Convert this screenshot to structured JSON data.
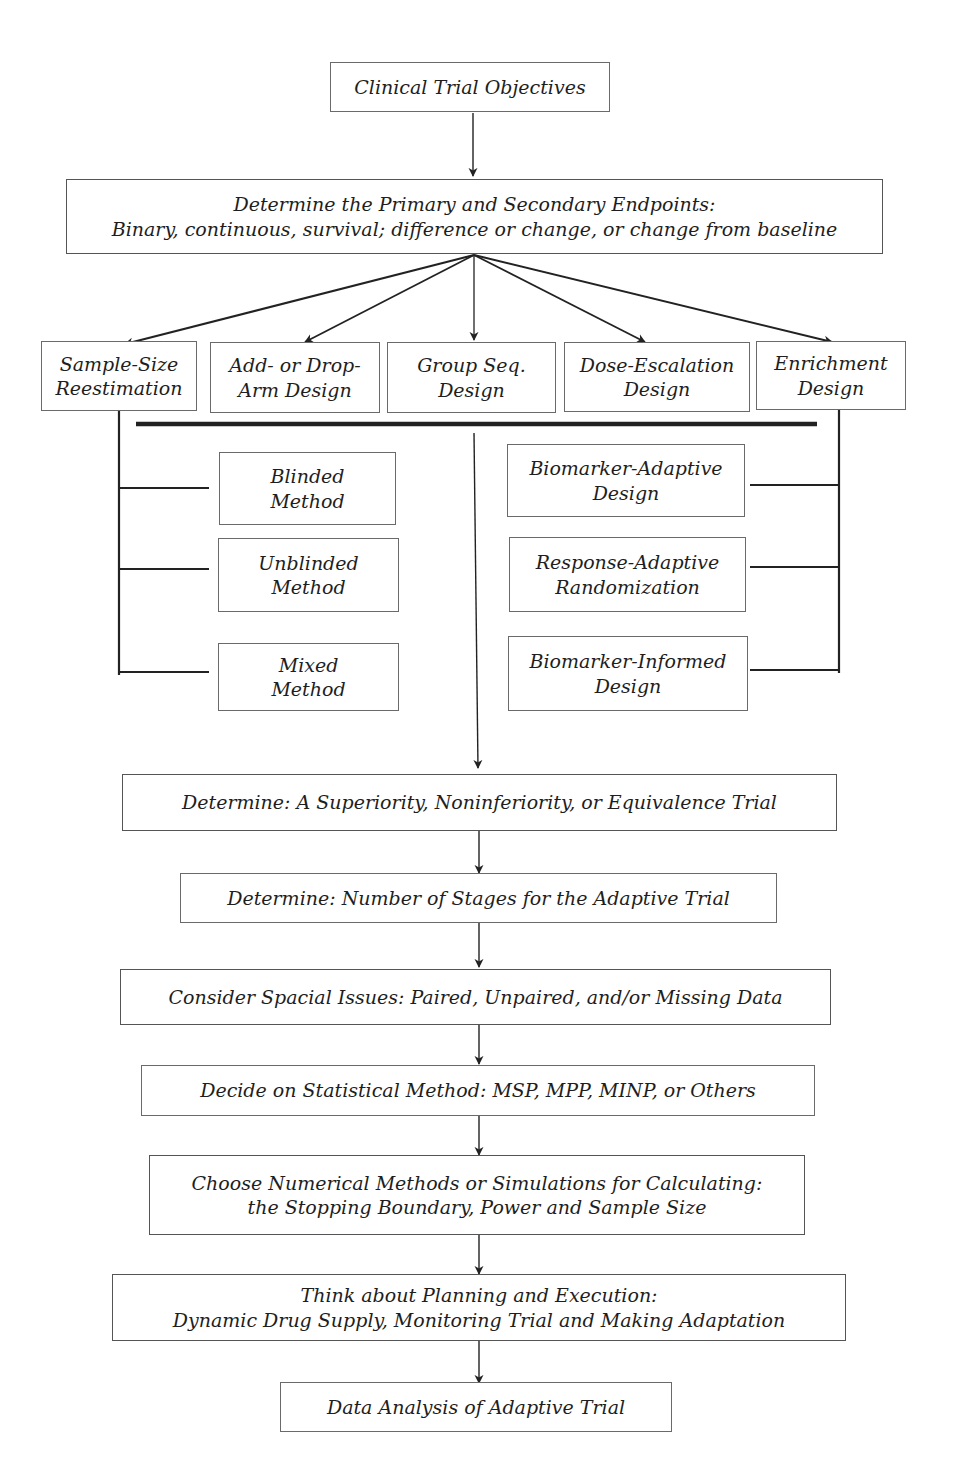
{
  "page": {
    "header_text": "Adaptive Clinical Trial Design",
    "page_number": ""
  },
  "flowchart": {
    "objectives": {
      "label": "Clinical Trial Objectives"
    },
    "endpoints": {
      "line1": "Determine the Primary and Secondary Endpoints:",
      "line2": "Binary, continuous, survival; difference or change, or change from baseline"
    },
    "designs": [
      {
        "line1": "Sample-Size",
        "line2": "Reestimation"
      },
      {
        "line1": "Add- or Drop-",
        "line2": "Arm Design"
      },
      {
        "line1": "Group Seq.",
        "line2": "Design"
      },
      {
        "line1": "Dose-Escalation",
        "line2": "Design"
      },
      {
        "line1": "Enrichment",
        "line2": "Design"
      }
    ],
    "ssr_methods": [
      {
        "line1": "Blinded",
        "line2": "Method"
      },
      {
        "line1": "Unblinded",
        "line2": "Method"
      },
      {
        "line1": "Mixed",
        "line2": "Method"
      }
    ],
    "enrichment_methods": [
      {
        "line1": "Biomarker-Adaptive",
        "line2": "Design"
      },
      {
        "line1": "Response-Adaptive",
        "line2": "Randomization"
      },
      {
        "line1": "Biomarker-Informed",
        "line2": "Design"
      }
    ],
    "steps": [
      {
        "line1": "Determine: A Superiority, Noninferiority, or Equivalence Trial",
        "line2": ""
      },
      {
        "line1": "Determine: Number of Stages for the Adaptive Trial",
        "line2": ""
      },
      {
        "line1": "Consider Spacial Issues: Paired, Unpaired, and/or Missing Data",
        "line2": ""
      },
      {
        "line1": "Decide on Statistical Method: MSP, MPP, MINP, or Others",
        "line2": ""
      },
      {
        "line1": "Choose Numerical Methods or Simulations for Calculating:",
        "line2": "the Stopping Boundary, Power and Sample Size"
      },
      {
        "line1": "Think about Planning and Execution:",
        "line2": "Dynamic Drug Supply, Monitoring Trial and Making Adaptation"
      },
      {
        "line1": "Data Analysis of Adaptive Trial",
        "line2": ""
      }
    ]
  },
  "colors": {
    "line": "#222222",
    "box_border": "#6a6a6a",
    "text": "#1e1e1e"
  }
}
